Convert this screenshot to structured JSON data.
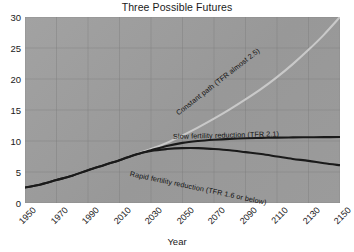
{
  "chart_data": {
    "type": "line",
    "title": "Three Possible Futures",
    "xlabel": "Year",
    "ylabel": "",
    "xlim": [
      1950,
      2150
    ],
    "ylim": [
      0,
      30
    ],
    "grid": true,
    "legend_position": "inline-annotations",
    "xticks": [
      "1950",
      "1970",
      "1990",
      "2010",
      "2030",
      "2050",
      "2070",
      "2090",
      "2110",
      "2130",
      "2150"
    ],
    "yticks": [
      "0",
      "5",
      "10",
      "15",
      "20",
      "25",
      "30"
    ],
    "x": [
      1950,
      1960,
      1970,
      1980,
      1990,
      2000,
      2010,
      2020,
      2030,
      2040,
      2050,
      2060,
      2070,
      2080,
      2090,
      2100,
      2110,
      2120,
      2130,
      2140,
      2150
    ],
    "series": [
      {
        "name": "Constant path (TFR almost 2.5)",
        "color": "#c9c9c9",
        "values": [
          2.5,
          3.0,
          3.7,
          4.4,
          5.3,
          6.1,
          6.9,
          7.8,
          8.7,
          9.7,
          10.9,
          12.2,
          13.6,
          15.1,
          16.7,
          18.4,
          20.3,
          22.4,
          24.7,
          27.2,
          30.0
        ]
      },
      {
        "name": "Slow fertility reduction (TFR 2.1)",
        "color": "#1a1a1a",
        "values": [
          2.5,
          3.0,
          3.7,
          4.4,
          5.3,
          6.1,
          6.9,
          7.8,
          8.5,
          9.2,
          9.7,
          10.0,
          10.2,
          10.35,
          10.45,
          10.5,
          10.55,
          10.58,
          10.6,
          10.62,
          10.65
        ]
      },
      {
        "name": "Rapid fertility reduction (TFR 1.6 or below)",
        "color": "#1a1a1a",
        "values": [
          2.5,
          3.0,
          3.7,
          4.4,
          5.3,
          6.1,
          6.9,
          7.8,
          8.4,
          8.7,
          8.85,
          8.85,
          8.7,
          8.5,
          8.2,
          7.9,
          7.5,
          7.1,
          6.8,
          6.4,
          6.1
        ]
      }
    ],
    "annotations": [
      {
        "text": "Constant path (TFR almost 2.5)",
        "series": "Constant path (TFR almost 2.5)"
      },
      {
        "text": "Slow fertility reduction (TFR 2.1)",
        "series": "Slow fertility reduction (TFR 2.1)"
      },
      {
        "text": "Rapid fertility reduction (TFR 1.6 or below)",
        "series": "Rapid fertility reduction (TFR 1.6 or below)"
      }
    ]
  }
}
